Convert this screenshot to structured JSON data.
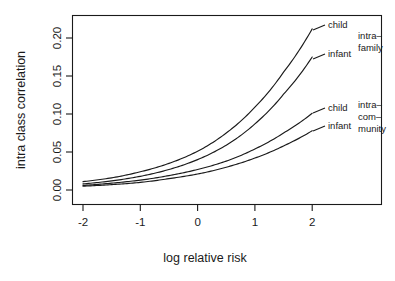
{
  "chart_data": {
    "type": "line",
    "title": "",
    "xlabel": "log relative risk",
    "ylabel": "intra class correlation",
    "xlim": [
      -2.2,
      2.2
    ],
    "ylim": [
      -0.005,
      0.225
    ],
    "xticks": [
      -2,
      -1,
      0,
      1,
      2
    ],
    "xticklabels": [
      "-2",
      "-1",
      "0",
      "1",
      "2"
    ],
    "yticks": [
      0.0,
      0.05,
      0.1,
      0.15,
      0.2
    ],
    "yticklabels": [
      "0.00",
      "0.05",
      "0.10",
      "0.15",
      "0.20"
    ],
    "grid": false,
    "legend_position": "right-inline-annotations",
    "x": [
      -2,
      -1.5,
      -1,
      -0.5,
      0,
      0.5,
      1,
      1.5,
      2
    ],
    "series": [
      {
        "name": "intra-family child",
        "group": "intra-family",
        "subject": "child",
        "values": [
          0.011,
          0.016,
          0.024,
          0.035,
          0.051,
          0.075,
          0.109,
          0.155,
          0.212
        ]
      },
      {
        "name": "intra-family infant",
        "group": "intra-family",
        "subject": "infant",
        "values": [
          0.008,
          0.012,
          0.018,
          0.027,
          0.04,
          0.059,
          0.087,
          0.126,
          0.175
        ]
      },
      {
        "name": "intra-community child",
        "group": "intra-community",
        "subject": "child",
        "values": [
          0.006,
          0.009,
          0.013,
          0.019,
          0.027,
          0.038,
          0.054,
          0.075,
          0.101
        ]
      },
      {
        "name": "intra-community infant",
        "group": "intra-community",
        "subject": "infant",
        "values": [
          0.005,
          0.007,
          0.01,
          0.015,
          0.021,
          0.03,
          0.042,
          0.058,
          0.078
        ]
      }
    ],
    "annotations": [
      {
        "text": "child",
        "series": "intra-family child"
      },
      {
        "text": "infant",
        "series": "intra-family infant"
      },
      {
        "text": "child",
        "series": "intra-community child"
      },
      {
        "text": "infant",
        "series": "intra-community infant"
      }
    ],
    "group_labels": [
      {
        "lines": [
          "intra–",
          "family"
        ]
      },
      {
        "lines": [
          "intra–",
          "com–",
          "munity"
        ]
      }
    ]
  },
  "axes": {
    "x_title": "log relative risk",
    "y_title": "intra class correlation",
    "x_tick_labels": [
      "-2",
      "-1",
      "0",
      "1",
      "2"
    ],
    "y_tick_labels": [
      "0.00",
      "0.05",
      "0.10",
      "0.15",
      "0.20"
    ]
  },
  "annotations": {
    "family_child": "child",
    "family_infant": "infant",
    "community_child": "child",
    "community_infant": "infant",
    "family_group_line1": "intra–",
    "family_group_line2": "family",
    "community_group_line1": "intra–",
    "community_group_line2": "com–",
    "community_group_line3": "munity"
  },
  "colors": {
    "ink": "#1a1a1a",
    "background": "#ffffff"
  }
}
